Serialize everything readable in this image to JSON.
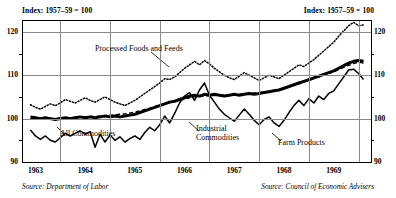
{
  "header": {
    "left": "Index: 1957–59 = 100",
    "right": "Index: 1957–59 = 100"
  },
  "sources": {
    "left": "Source: Department of Labor",
    "right": "Source: Council of Economic Advisers"
  },
  "labels": {
    "processed": "Processed Foods and Feeds",
    "all": "All Commodities",
    "industrial_line1": "Industrial",
    "industrial_line2": "Commodities",
    "farm": "Farm Products"
  },
  "axis": {
    "y_major": [
      "120",
      "110",
      "100",
      "90"
    ],
    "y_minor": [
      "115",
      "105",
      "95"
    ],
    "x_years": [
      "1963",
      "1964",
      "1965",
      "1966",
      "1967",
      "1968",
      "1969"
    ]
  },
  "chart_data": {
    "type": "line",
    "title": "Index: 1957–59 = 100",
    "xlabel": "",
    "ylabel": "Index: 1957–59 = 100",
    "ylim": [
      90,
      122.5
    ],
    "xlim": [
      1962.75,
      1969.75
    ],
    "grid": true,
    "legend": "annotations-on-plot",
    "yticks": [
      90,
      95,
      100,
      105,
      110,
      115,
      120
    ],
    "ytick_labels": [
      "90",
      "",
      "100",
      "",
      "110",
      "",
      "120"
    ],
    "xticks": [
      1963,
      1964,
      1965,
      1966,
      1967,
      1968,
      1969
    ],
    "annotations": [
      {
        "text": "Processed Foods and Feeds",
        "points_to_series": "Processed Foods and Feeds"
      },
      {
        "text": "All Commodities",
        "points_to_series": "All Commodities"
      },
      {
        "text": "Industrial Commodities",
        "points_to_series": "Industrial Commodities"
      },
      {
        "text": "Farm Products",
        "points_to_series": "Farm Products"
      }
    ],
    "x": [
      1962.9,
      1963.0,
      1963.1,
      1963.2,
      1963.3,
      1963.4,
      1963.5,
      1963.6,
      1963.7,
      1963.8,
      1963.9,
      1964.0,
      1964.1,
      1964.2,
      1964.3,
      1964.4,
      1964.5,
      1964.6,
      1964.7,
      1964.8,
      1964.9,
      1965.0,
      1965.1,
      1965.2,
      1965.3,
      1965.4,
      1965.5,
      1965.6,
      1965.7,
      1965.8,
      1965.9,
      1966.0,
      1966.1,
      1966.2,
      1966.3,
      1966.4,
      1966.5,
      1966.6,
      1966.7,
      1966.8,
      1966.9,
      1967.0,
      1967.1,
      1967.2,
      1967.3,
      1967.4,
      1967.5,
      1967.6,
      1967.7,
      1967.8,
      1967.9,
      1968.0,
      1968.1,
      1968.2,
      1968.3,
      1968.4,
      1968.5,
      1968.6,
      1968.7,
      1968.8,
      1968.9,
      1969.0,
      1969.1,
      1969.2,
      1969.3,
      1969.4,
      1969.5,
      1969.6
    ],
    "series": [
      {
        "name": "Processed Foods and Feeds",
        "style": "dotted",
        "values": [
          103.2,
          102.6,
          102.2,
          102.8,
          103.4,
          103.0,
          103.6,
          104.4,
          104.0,
          103.6,
          104.2,
          104.8,
          104.2,
          103.8,
          104.4,
          105.0,
          104.4,
          103.8,
          103.4,
          103.0,
          103.6,
          104.2,
          105.0,
          105.8,
          106.6,
          107.4,
          108.2,
          109.2,
          109.0,
          109.6,
          110.6,
          111.6,
          112.4,
          113.2,
          112.4,
          113.4,
          112.6,
          111.6,
          110.8,
          110.0,
          109.4,
          109.0,
          109.8,
          110.6,
          110.0,
          109.4,
          108.8,
          109.4,
          110.0,
          109.6,
          109.2,
          110.0,
          110.8,
          111.6,
          112.4,
          112.0,
          112.8,
          113.6,
          114.6,
          115.6,
          116.6,
          117.6,
          119.0,
          120.2,
          121.4,
          122.2,
          121.4,
          121.6
        ]
      },
      {
        "name": "All Commodities",
        "style": "thick-solid",
        "values": [
          100.4,
          100.2,
          100.0,
          100.2,
          100.0,
          99.8,
          100.0,
          100.2,
          100.0,
          100.2,
          100.4,
          100.2,
          100.4,
          100.2,
          100.4,
          100.6,
          100.4,
          100.6,
          100.4,
          100.6,
          100.8,
          101.0,
          101.4,
          101.8,
          102.2,
          102.6,
          103.0,
          103.4,
          103.8,
          104.0,
          104.4,
          104.8,
          105.2,
          105.4,
          105.2,
          105.6,
          105.4,
          105.6,
          105.4,
          105.2,
          105.4,
          105.6,
          105.4,
          105.6,
          105.8,
          105.6,
          105.8,
          106.0,
          106.2,
          106.4,
          106.6,
          107.0,
          107.4,
          107.8,
          108.2,
          108.6,
          109.0,
          109.4,
          109.8,
          110.2,
          110.6,
          111.0,
          111.6,
          112.2,
          112.8,
          113.2,
          113.4,
          113.2
        ]
      },
      {
        "name": "Industrial Commodities",
        "style": "dashed",
        "values": [
          100.0,
          100.0,
          100.1,
          100.1,
          100.0,
          100.0,
          100.1,
          100.2,
          100.2,
          100.3,
          100.4,
          100.4,
          100.5,
          100.5,
          100.6,
          100.7,
          100.8,
          100.9,
          101.0,
          101.1,
          101.3,
          101.5,
          101.8,
          102.1,
          102.4,
          102.8,
          103.1,
          103.4,
          103.7,
          104.0,
          104.2,
          104.5,
          104.8,
          105.0,
          105.1,
          105.2,
          105.3,
          105.3,
          105.4,
          105.4,
          105.5,
          105.6,
          105.6,
          105.7,
          105.8,
          105.9,
          106.0,
          106.1,
          106.3,
          106.5,
          106.7,
          107.0,
          107.3,
          107.7,
          108.0,
          108.4,
          108.8,
          109.2,
          109.6,
          110.0,
          110.4,
          110.8,
          111.3,
          111.8,
          112.3,
          112.7,
          113.0,
          112.8
        ]
      },
      {
        "name": "Farm Products",
        "style": "thin-solid",
        "values": [
          97.4,
          96.0,
          95.2,
          96.0,
          95.0,
          94.6,
          95.6,
          96.6,
          96.0,
          96.6,
          97.2,
          96.4,
          97.0,
          93.4,
          96.4,
          94.6,
          96.2,
          95.0,
          95.8,
          94.6,
          95.4,
          96.0,
          95.2,
          96.8,
          98.0,
          97.2,
          98.6,
          100.6,
          99.0,
          101.2,
          103.6,
          105.2,
          106.0,
          104.2,
          106.6,
          108.2,
          105.4,
          103.8,
          102.2,
          101.0,
          100.2,
          99.4,
          100.8,
          102.2,
          101.0,
          99.6,
          98.6,
          99.8,
          100.4,
          99.0,
          98.2,
          99.6,
          101.4,
          103.0,
          104.2,
          103.0,
          104.6,
          103.6,
          105.2,
          104.4,
          105.8,
          106.4,
          108.0,
          109.6,
          111.2,
          111.4,
          110.4,
          109.0
        ]
      }
    ]
  }
}
